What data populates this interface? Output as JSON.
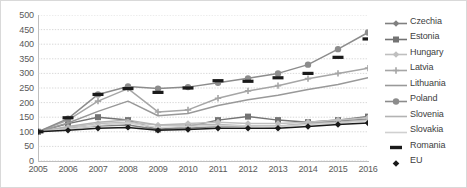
{
  "chart_data": {
    "type": "line",
    "title": "",
    "xlabel": "",
    "ylabel": "",
    "ylim": [
      0,
      500
    ],
    "ytick_values": [
      500,
      450,
      400,
      350,
      300,
      250,
      200,
      150,
      100,
      50,
      0
    ],
    "grid": true,
    "legend_position": "right",
    "x": [
      2005,
      2006,
      2007,
      2008,
      2009,
      2010,
      2011,
      2012,
      2013,
      2014,
      2015,
      2016
    ],
    "categories": [
      "2005",
      "2006",
      "2007",
      "2008",
      "2009",
      "2010",
      "2011",
      "2012",
      "2013",
      "2014",
      "2015",
      "2016"
    ],
    "series": [
      {
        "name": "Czechia",
        "color": "#808080",
        "marker": "diamond",
        "values": [
          100,
          112,
          120,
          123,
          108,
          112,
          118,
          120,
          118,
          128,
          138,
          143
        ]
      },
      {
        "name": "Estonia",
        "color": "#737373",
        "marker": "square",
        "values": [
          100,
          128,
          150,
          140,
          108,
          118,
          140,
          152,
          140,
          133,
          140,
          152
        ]
      },
      {
        "name": "Hungary",
        "color": "#bfbfbf",
        "marker": "diamond",
        "values": [
          100,
          115,
          128,
          133,
          123,
          128,
          133,
          128,
          128,
          133,
          140,
          148
        ]
      },
      {
        "name": "Latvia",
        "color": "#a6a6a6",
        "marker": "plus",
        "values": [
          100,
          140,
          205,
          248,
          168,
          175,
          215,
          240,
          258,
          282,
          300,
          318
        ]
      },
      {
        "name": "Lithuania",
        "color": "#999999",
        "marker": "none",
        "values": [
          100,
          130,
          170,
          205,
          155,
          163,
          190,
          210,
          225,
          245,
          262,
          285
        ]
      },
      {
        "name": "Poland",
        "color": "#8c8c8c",
        "marker": "circle",
        "values": [
          100,
          145,
          228,
          255,
          248,
          253,
          268,
          283,
          300,
          330,
          383,
          440
        ]
      },
      {
        "name": "Slovenia",
        "color": "#b3b3b3",
        "marker": "none",
        "values": [
          100,
          118,
          133,
          140,
          123,
          123,
          125,
          120,
          120,
          128,
          133,
          140
        ]
      },
      {
        "name": "Slovakia",
        "color": "#d0d0d0",
        "marker": "none",
        "values": [
          100,
          110,
          122,
          130,
          115,
          118,
          122,
          120,
          118,
          125,
          130,
          138
        ]
      },
      {
        "name": "Romania",
        "color": "#1a1a1a",
        "marker": "dash",
        "values": [
          100,
          148,
          228,
          248,
          235,
          250,
          275,
          273,
          285,
          300,
          355,
          418
        ]
      },
      {
        "name": "EU",
        "color": "#1a1a1a",
        "marker": "diamond-small",
        "values": [
          100,
          105,
          112,
          115,
          105,
          108,
          112,
          112,
          112,
          118,
          125,
          130
        ]
      }
    ]
  },
  "legend": {
    "items": [
      {
        "label": "Czechia"
      },
      {
        "label": "Estonia"
      },
      {
        "label": "Hungary"
      },
      {
        "label": "Latvia"
      },
      {
        "label": "Lithuania"
      },
      {
        "label": "Poland"
      },
      {
        "label": "Slovenia"
      },
      {
        "label": "Slovakia"
      },
      {
        "label": "Romania"
      },
      {
        "label": "EU"
      }
    ]
  }
}
